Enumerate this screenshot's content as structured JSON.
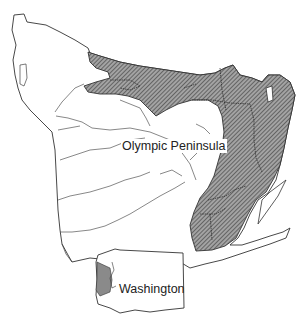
{
  "map": {
    "main_label": "Olympic Peninsula",
    "inset_label": "Washington",
    "colors": {
      "background": "#ffffff",
      "outline": "#333333",
      "hatch_fill": "#9a9a9a",
      "hatch_line": "#333333"
    },
    "legend": {
      "shaded_region": "hatched area (shaded region on peninsula)"
    }
  }
}
